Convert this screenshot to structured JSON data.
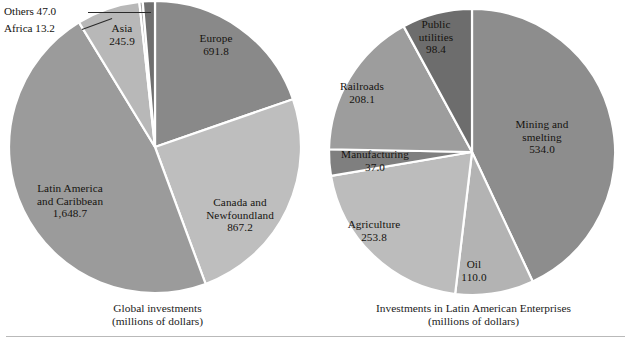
{
  "figure": {
    "background": "#ffffff",
    "rule_color": "#b9b9b9"
  },
  "chart_data": [
    {
      "type": "pie",
      "id": "global-investments",
      "title": "Global investments",
      "subtitle": "(millions of dollars)",
      "unit": "millions of dollars",
      "total": 3513.8,
      "legend": "none",
      "labels_inside": true,
      "categories": [
        "Europe",
        "Canada and Newfoundland",
        "Latin America and Caribbean",
        "Asia",
        "Africa",
        "Others"
      ],
      "values": [
        691.8,
        867.2,
        1648.7,
        245.9,
        13.2,
        47.0
      ],
      "value_texts": [
        "691.8",
        "867.2",
        "1,648.7",
        "245.9",
        "13.2",
        "47.0"
      ],
      "colors": [
        "#898989",
        "#bebebe",
        "#9b9b9b",
        "#b8b8b8",
        "#a5a5a5",
        "#6f6f6f"
      ],
      "slices": [
        {
          "name": "Europe",
          "value": 691.8,
          "value_text": "691.8",
          "label_lines": [
            "Europe",
            "691.8"
          ],
          "color": "#898989",
          "label_x": 215,
          "label_y": 38,
          "callout": false
        },
        {
          "name": "Canada and Newfoundland",
          "value": 867.2,
          "value_text": "867.2",
          "label_lines": [
            "Canada and",
            "Newfoundland",
            "867.2"
          ],
          "color": "#bebebe",
          "label_x": 243,
          "label_y": 205,
          "callout": false
        },
        {
          "name": "Latin America and Caribbean",
          "value": 1648.7,
          "value_text": "1,648.7",
          "label_lines": [
            "Latin America",
            "and Caribbean",
            "1,648.7"
          ],
          "color": "#9b9b9b",
          "label_x": 68,
          "label_y": 182,
          "callout": false
        },
        {
          "name": "Asia",
          "value": 245.9,
          "value_text": "245.9",
          "label_lines": [
            "Asia",
            "245.9"
          ],
          "color": "#b8b8b8",
          "label_x": 119,
          "label_y": 27,
          "callout": false
        },
        {
          "name": "Africa",
          "value": 13.2,
          "value_text": "13.2",
          "label_lines": [
            "Africa  13.2"
          ],
          "color": "#a5a5a5",
          "label_x": 3,
          "label_y": 23,
          "callout": true
        },
        {
          "name": "Others",
          "value": 47.0,
          "value_text": "47.0",
          "label_lines": [
            "Others  47.0"
          ],
          "color": "#6f6f6f",
          "label_x": 3,
          "label_y": 6,
          "callout": true
        }
      ]
    },
    {
      "type": "pie",
      "id": "latin-american-enterprises",
      "title": "Investments in Latin American Enterprises",
      "subtitle": "(millions of dollars)",
      "unit": "millions of dollars",
      "total": 1241.3,
      "legend": "none",
      "labels_inside": true,
      "categories": [
        "Mining and smelting",
        "Oil",
        "Agriculture",
        "Manufacturing",
        "Railroads",
        "Public utilities"
      ],
      "values": [
        534.0,
        110.0,
        253.8,
        37.0,
        208.1,
        98.4
      ],
      "value_texts": [
        "534.0",
        "110.0",
        "253.8",
        "37.0",
        "208.1",
        "98.4"
      ],
      "colors": [
        "#8d8d8d",
        "#b3b3b3",
        "#bcbcbc",
        "#7f7f7f",
        "#9d9d9d",
        "#6d6d6d"
      ],
      "slices": [
        {
          "name": "Mining and smelting",
          "value": 534.0,
          "value_text": "534.0",
          "label_lines": [
            "Mining and",
            "smelting",
            "534.0"
          ],
          "color": "#8d8d8d",
          "label_x": 540,
          "label_y": 122,
          "callout": false
        },
        {
          "name": "Oil",
          "value": 110.0,
          "value_text": "110.0",
          "label_lines": [
            "Oil",
            "110.0"
          ],
          "color": "#b3b3b3",
          "label_x": 472,
          "label_y": 262,
          "callout": false
        },
        {
          "name": "Agriculture",
          "value": 253.8,
          "value_text": "253.8",
          "label_lines": [
            "Agriculture",
            "253.8"
          ],
          "color": "#bcbcbc",
          "label_x": 372,
          "label_y": 222,
          "callout": false
        },
        {
          "name": "Manufacturing",
          "value": 37.0,
          "value_text": "37.0",
          "label_lines": [
            "Manufacturing",
            "37.0"
          ],
          "color": "#7f7f7f",
          "label_x": 336,
          "label_y": 152,
          "callout": false
        },
        {
          "name": "Railroads",
          "value": 208.1,
          "value_text": "208.1",
          "label_lines": [
            "Railroads",
            "208.1"
          ],
          "color": "#9d9d9d",
          "label_x": 357,
          "label_y": 84,
          "callout": false
        },
        {
          "name": "Public utilities",
          "value": 98.4,
          "value_text": "98.4",
          "label_lines": [
            "Public",
            "utilities",
            "98.4"
          ],
          "color": "#6d6d6d",
          "label_x": 432,
          "label_y": 22,
          "callout": false
        }
      ]
    }
  ],
  "left": {
    "caption_line1": "Global investments",
    "caption_line2": "(millions of dollars)",
    "europe_line1": "Europe",
    "europe_line2": "691.8",
    "canada_line1": "Canada and",
    "canada_line2": "Newfoundland",
    "canada_line3": "867.2",
    "latam_line1": "Latin America",
    "latam_line2": "and Caribbean",
    "latam_line3": "1,648.7",
    "asia_line1": "Asia",
    "asia_line2": "245.9",
    "others_callout": "Others  47.0",
    "africa_callout": "Africa  13.2"
  },
  "right": {
    "caption_line1": "Investments in Latin American Enterprises",
    "caption_line2": "(millions of dollars)",
    "mining_line1": "Mining and",
    "mining_line2": "smelting",
    "mining_line3": "534.0",
    "oil_line1": "Oil",
    "oil_line2": "110.0",
    "agriculture_line1": "Agriculture",
    "agriculture_line2": "253.8",
    "manufacturing_line1": "Manufacturing",
    "manufacturing_line2": "37.0",
    "railroads_line1": "Railroads",
    "railroads_line2": "208.1",
    "utilities_line1": "Public",
    "utilities_line2": "utilities",
    "utilities_line3": "98.4"
  }
}
